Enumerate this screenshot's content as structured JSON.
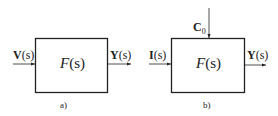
{
  "diagrams": [
    {
      "id": "a",
      "caption": "a)",
      "block": {
        "func": "F",
        "arg": "(s)"
      },
      "input": {
        "sym": "V",
        "arg": "(s)"
      },
      "output": {
        "sym": "Y",
        "arg": "(s)"
      }
    },
    {
      "id": "b",
      "caption": "b)",
      "block": {
        "func": "F",
        "arg": "(s)"
      },
      "input": {
        "sym": "I",
        "arg": "(s)"
      },
      "disturbance": {
        "sym": "C",
        "sub": "0"
      },
      "output": {
        "sym": "Y",
        "arg": "(s)"
      }
    }
  ],
  "colors": {
    "line": "#222222",
    "background": "#ffffff"
  }
}
